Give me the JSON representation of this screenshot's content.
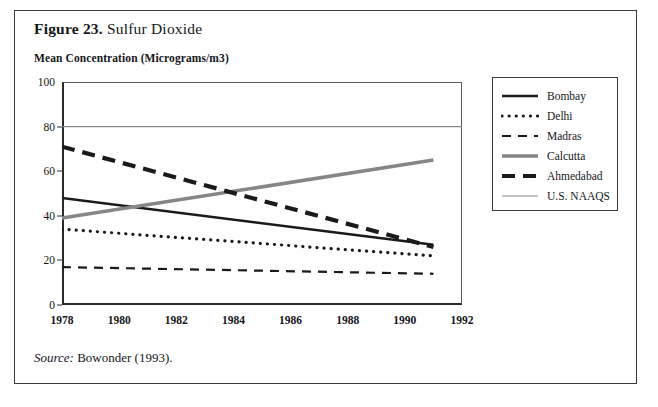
{
  "figure": {
    "number_label": "Figure 23.",
    "title": "Sulfur Dioxide",
    "source": "Bowonder (1993).",
    "source_prefix": "Source:"
  },
  "legend": {
    "position": "right",
    "items": [
      {
        "label": "Bombay",
        "style": "solid-thick",
        "color": "#1a1a1a"
      },
      {
        "label": "Delhi",
        "style": "dotted",
        "color": "#1a1a1a"
      },
      {
        "label": "Madras",
        "style": "dashed-thin",
        "color": "#1a1a1a"
      },
      {
        "label": "Calcutta",
        "style": "solid-gray",
        "color": "#868686"
      },
      {
        "label": "Ahmedabad",
        "style": "dashed-thick",
        "color": "#1a1a1a"
      },
      {
        "label": "U.S. NAAQS",
        "style": "solid-thin",
        "color": "#868686"
      }
    ]
  },
  "chart_data": {
    "type": "line",
    "title": "Sulfur Dioxide",
    "xlabel": "",
    "ylabel": "Mean Concentration (Micrograms/m3)",
    "xlim": [
      1978,
      1992
    ],
    "ylim": [
      0,
      100
    ],
    "xticks": [
      1978,
      1980,
      1982,
      1984,
      1986,
      1988,
      1990,
      1992
    ],
    "yticks": [
      0,
      20,
      40,
      60,
      80,
      100
    ],
    "grid": false,
    "x": [
      1978,
      1991
    ],
    "series": [
      {
        "name": "Bombay",
        "values": [
          48,
          27
        ],
        "color": "#1a1a1a",
        "style": "solid-thick"
      },
      {
        "name": "Delhi",
        "values": [
          34,
          22
        ],
        "color": "#1a1a1a",
        "style": "dotted"
      },
      {
        "name": "Madras",
        "values": [
          17,
          14
        ],
        "color": "#1a1a1a",
        "style": "dashed-thin"
      },
      {
        "name": "Calcutta",
        "values": [
          39,
          65
        ],
        "color": "#868686",
        "style": "solid-gray"
      },
      {
        "name": "Ahmedabad",
        "values": [
          71,
          26
        ],
        "color": "#1a1a1a",
        "style": "dashed-thick"
      }
    ],
    "reference_lines": [
      {
        "name": "U.S. NAAQS",
        "value": 80,
        "color": "#868686",
        "style": "solid-thin"
      }
    ]
  }
}
